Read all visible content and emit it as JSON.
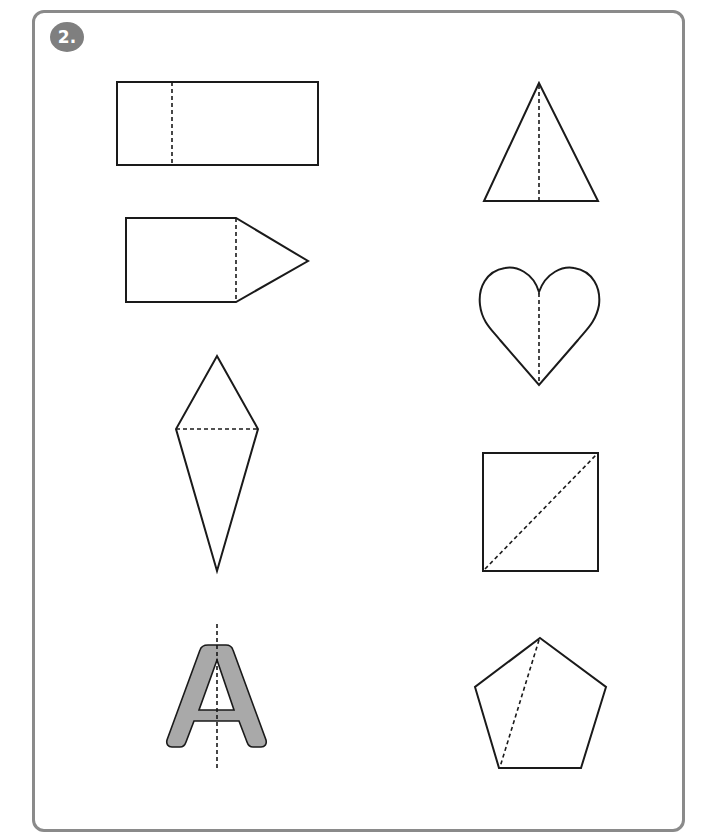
{
  "exercise": {
    "number_label": "2.",
    "frame_color": "#8a8a8a",
    "badge_color": "#7f7f7f"
  },
  "shapes": [
    {
      "id": "rectangle",
      "name": "Rectangle",
      "fold_line": "vertical line near left side",
      "position": "row 1, left"
    },
    {
      "id": "triangle",
      "name": "Triangle",
      "fold_line": "vertical line from apex to base midpoint",
      "position": "row 1, right"
    },
    {
      "id": "pentagon-arrow",
      "name": "Arrow pentagon (house on its side)",
      "fold_line": "vertical line between square and point",
      "position": "row 2, left"
    },
    {
      "id": "heart",
      "name": "Heart",
      "fold_line": "vertical center line",
      "position": "row 2, right"
    },
    {
      "id": "kite",
      "name": "Kite",
      "fold_line": "horizontal line across widest part",
      "position": "row 3, left"
    },
    {
      "id": "square",
      "name": "Square",
      "fold_line": "diagonal from bottom-left to top-right",
      "position": "row 3, right"
    },
    {
      "id": "letter-a",
      "name": "Letter A",
      "fold_line": "vertical center line",
      "fill_color": "#a9a9a9",
      "position": "row 4, left"
    },
    {
      "id": "pentagon",
      "name": "Regular pentagon",
      "fold_line": "line from top vertex to bottom-left vertex",
      "position": "row 4, right"
    }
  ]
}
